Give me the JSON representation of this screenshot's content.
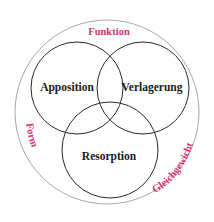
{
  "diagram": {
    "outer_circle": {
      "labels": {
        "top": "Funktion",
        "left": "Form",
        "right": "Gleichgewicht"
      },
      "label_color": "#d6336c",
      "stroke": "#a8a8a8"
    },
    "inner_circles": [
      {
        "label": "Apposition"
      },
      {
        "label": "Verlagerung"
      },
      {
        "label": "Resorption"
      }
    ],
    "inner_stroke": "#2a2a2a"
  }
}
